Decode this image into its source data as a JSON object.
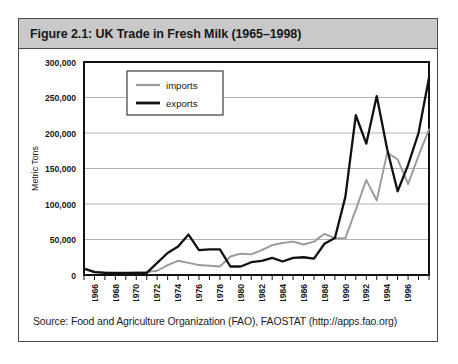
{
  "figure": {
    "caption": "Figure 2.1: UK Trade in Fresh Milk (1965–1998)",
    "source": "Source: Food and Agriculture Organization (FAO), FAOSTAT (http://apps.fao.org)"
  },
  "colors": {
    "frame": "#4a4a4a",
    "caption_bar": "#c9c9c9",
    "plot_border": "#111111",
    "gridline": "#a9a9a9",
    "exports_line": "#111111",
    "imports_line": "#9a9a9a",
    "text": "#171717"
  },
  "chart_data": {
    "type": "line",
    "title": "UK Trade in Fresh Milk (1965–1998)",
    "xlabel": "",
    "ylabel": "Metric Tons",
    "ylim": [
      0,
      300000
    ],
    "ytick_labels": [
      "0",
      "50,000",
      "100,000",
      "150,000",
      "200,000",
      "250,000",
      "300,000"
    ],
    "ytick_values": [
      0,
      50000,
      100000,
      150000,
      200000,
      250000,
      300000
    ],
    "xlim": [
      1965,
      1998
    ],
    "xtick_labels": [
      "1966",
      "1968",
      "1970",
      "1972",
      "1974",
      "1976",
      "1978",
      "1980",
      "1982",
      "1984",
      "1986",
      "1988",
      "1990",
      "1992",
      "1994",
      "1996"
    ],
    "xtick_values": [
      1966,
      1968,
      1970,
      1972,
      1974,
      1976,
      1978,
      1980,
      1982,
      1984,
      1986,
      1988,
      1990,
      1992,
      1994,
      1996
    ],
    "x": [
      1965,
      1966,
      1967,
      1968,
      1969,
      1970,
      1971,
      1972,
      1973,
      1974,
      1975,
      1976,
      1977,
      1978,
      1979,
      1980,
      1981,
      1982,
      1983,
      1984,
      1985,
      1986,
      1987,
      1988,
      1989,
      1990,
      1991,
      1992,
      1993,
      1994,
      1995,
      1996,
      1997,
      1998
    ],
    "grid": true,
    "legend_position": "top-left-inside",
    "series": [
      {
        "name": "imports",
        "color": "#9a9a9a",
        "values": [
          9000,
          5000,
          3500,
          3000,
          3000,
          3500,
          4000,
          6000,
          14000,
          20000,
          17000,
          14000,
          13000,
          12000,
          26000,
          30000,
          29000,
          35000,
          42000,
          45000,
          47000,
          43000,
          47000,
          58000,
          52000,
          52000,
          92000,
          134000,
          105000,
          172000,
          163000,
          128000,
          168000,
          205000
        ]
      },
      {
        "name": "exports",
        "color": "#111111",
        "values": [
          9000,
          4000,
          3000,
          3000,
          3000,
          3000,
          3000,
          17000,
          31000,
          40000,
          57000,
          35000,
          36000,
          36000,
          12000,
          12000,
          18000,
          20000,
          24000,
          19000,
          24000,
          25000,
          23000,
          44000,
          52000,
          110000,
          225000,
          185000,
          252000,
          177000,
          118000,
          155000,
          200000,
          278000
        ]
      }
    ]
  },
  "legend": {
    "entries": [
      {
        "label": "imports",
        "color": "#9a9a9a"
      },
      {
        "label": "exports",
        "color": "#111111"
      }
    ]
  }
}
